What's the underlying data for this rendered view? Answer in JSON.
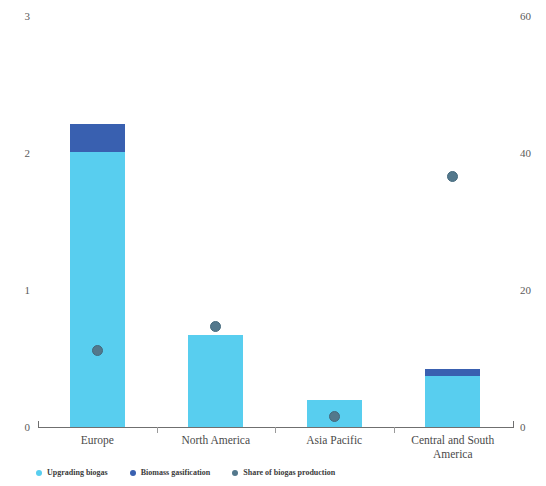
{
  "chart_data": {
    "type": "bar",
    "title": "",
    "subtitle": "",
    "xlabel": "",
    "ylabel": "",
    "y2label": "",
    "categories": [
      "Europe",
      "North America",
      "Asia Pacific",
      "Central and South America"
    ],
    "series": [
      {
        "name": "Upgrading biogas",
        "type": "bar",
        "stack": "total",
        "axis": "left",
        "color": "#58ceef",
        "values": [
          2.01,
          0.67,
          0.2,
          0.37
        ]
      },
      {
        "name": "Biomass gasification",
        "type": "bar",
        "stack": "total",
        "axis": "left",
        "color": "#3960b0",
        "values": [
          0.2,
          0.0,
          0.0,
          0.05
        ]
      },
      {
        "name": "Share of biogas production",
        "type": "scatter",
        "axis": "right",
        "color": "#53788c",
        "values": [
          11.2,
          14.6,
          1.6,
          36.5
        ]
      }
    ],
    "ylim": [
      0,
      3
    ],
    "yticks": [
      0,
      1,
      2,
      3
    ],
    "ytick_labels": [
      "0",
      "1",
      "2",
      "3"
    ],
    "y2lim": [
      0,
      60
    ],
    "y2ticks": [
      0,
      20,
      40,
      60
    ],
    "y2tick_labels": [
      "0",
      "20",
      "40",
      "60"
    ],
    "grid": false,
    "legend_position": "bottom-left",
    "watermark": "fotech"
  },
  "legend": {
    "items": [
      {
        "label": "Upgrading biogas",
        "color": "#58ceef"
      },
      {
        "label": "Biomass gasification",
        "color": "#3960b0"
      },
      {
        "label": "Share of biogas production",
        "color": "#53788c"
      }
    ]
  }
}
